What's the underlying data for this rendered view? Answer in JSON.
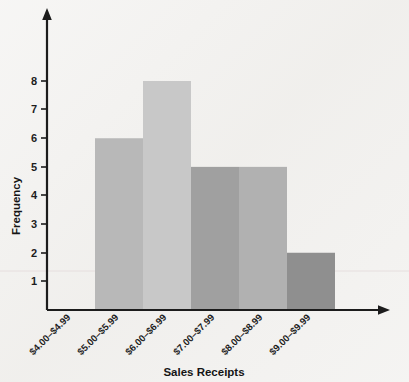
{
  "chart_data": {
    "type": "bar",
    "title": "",
    "subtitle": "",
    "xlabel": "Sales Receipts",
    "ylabel": "Frequency",
    "categories": [
      "$4.00–$4.99",
      "$5.00–$5.99",
      "$6.00–$6.99",
      "$7.00–$7.99",
      "$8.00–$8.99",
      "$9.00–$9.99"
    ],
    "values": [
      0,
      6,
      8,
      5,
      5,
      2
    ],
    "bar_colors": [
      "#f2f1ef",
      "#b8b8b8",
      "#c8c8c8",
      "#a0a0a0",
      "#b1b1b1",
      "#8f8f8f"
    ],
    "ylim": [
      0,
      9
    ],
    "yticks": [
      1,
      2,
      3,
      4,
      5,
      6,
      7,
      8
    ],
    "ytick_labels": [
      "1",
      "2",
      "3",
      "4",
      "5",
      "6",
      "7",
      "8"
    ],
    "grid": false,
    "legend": "none",
    "x_label_rotation": 45,
    "axis_color": "#1c1c1c",
    "background_color": "#f2f1ef"
  },
  "labels": {
    "y_axis_title": "Frequency",
    "x_axis_title": "Sales Receipts",
    "ytick_1": "1",
    "ytick_2": "2",
    "ytick_3": "3",
    "ytick_4": "4",
    "ytick_5": "5",
    "ytick_6": "6",
    "ytick_7": "7",
    "ytick_8": "8",
    "xcat_1": "$4.00–$4.99",
    "xcat_2": "$5.00–$5.99",
    "xcat_3": "$6.00–$6.99",
    "xcat_4": "$7.00–$7.99",
    "xcat_5": "$8.00–$8.99",
    "xcat_6": "$9.00–$9.99"
  }
}
